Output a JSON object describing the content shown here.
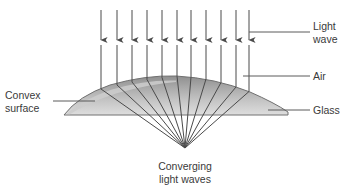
{
  "diagram": {
    "title_caption": "Converging\nlight waves",
    "labels": {
      "light_wave_line1": "Light",
      "light_wave_line2": "wave",
      "air": "Air",
      "glass": "Glass",
      "convex_line1": "Convex",
      "convex_line2": "surface",
      "caption_line1": "Converging",
      "caption_line2": "light waves"
    },
    "colors": {
      "ray": "#4a4a4a",
      "leader": "#5a5a5a",
      "text": "#3a3a3a",
      "lens_outline": "#707070",
      "lens_fill_top": "#9a9a9a",
      "lens_fill_mid": "#b4b4b4",
      "lens_fill_bottom": "#d8d8d8",
      "background": "#ffffff"
    },
    "geometry": {
      "ray_count": 11,
      "ray_top_y": 10,
      "arrow_tip_y": 45,
      "focal_x": 185,
      "focal_y": 148,
      "lens_left_x": 64,
      "lens_right_x": 288,
      "lens_base_y": 115,
      "lens_apex_x": 176,
      "lens_apex_y": 76,
      "ray_x_positions": [
        101,
        117,
        132,
        147,
        162,
        177,
        191,
        206,
        221,
        236,
        249
      ]
    }
  }
}
